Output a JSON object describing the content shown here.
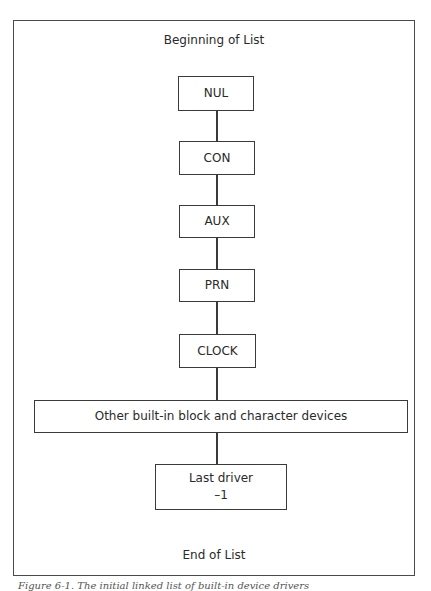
{
  "diagram": {
    "top_label": "Beginning of List",
    "bottom_label": "End of List",
    "nodes": [
      {
        "id": "nul",
        "label": "NUL"
      },
      {
        "id": "con",
        "label": "CON"
      },
      {
        "id": "aux",
        "label": "AUX"
      },
      {
        "id": "prn",
        "label": "PRN"
      },
      {
        "id": "clock",
        "label": "CLOCK"
      },
      {
        "id": "other",
        "label": "Other built-in block and character devices"
      },
      {
        "id": "last",
        "label": "Last driver",
        "sublabel": "–1"
      }
    ],
    "caption": "Figure 6-1. The initial linked list of built-in device drivers"
  }
}
